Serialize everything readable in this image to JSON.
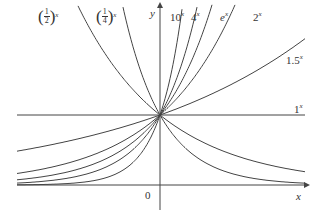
{
  "chart_data": {
    "type": "line",
    "title": "",
    "xlabel": "x",
    "ylabel": "y",
    "origin_label": "0",
    "series": [
      {
        "name": "(1/2)^x",
        "base": 0.5
      },
      {
        "name": "(1/4)^x",
        "base": 0.25
      },
      {
        "name": "10^x",
        "base": 10
      },
      {
        "name": "4^x",
        "base": 4
      },
      {
        "name": "e^x",
        "base": 2.718
      },
      {
        "name": "2^x",
        "base": 2
      },
      {
        "name": "1.5^x",
        "base": 1.5
      },
      {
        "name": "1^x",
        "base": 1
      }
    ],
    "common_point": [
      0,
      1
    ],
    "grid": false,
    "legend": "inline labels at curve ends"
  },
  "layout": {
    "origin_px": [
      160,
      185
    ],
    "unit_y_px": 70,
    "unit_x_px": 55,
    "x_axis": {
      "from": 17,
      "to": 305
    },
    "y_axis": {
      "from": 210,
      "to": 6
    },
    "line_color": "#444444"
  },
  "labels": {
    "half": {
      "num": "1",
      "den": "2",
      "exp": "x"
    },
    "quarter": {
      "num": "1",
      "den": "4",
      "exp": "x"
    },
    "ten": {
      "base": "10",
      "exp": "x"
    },
    "four": {
      "base": "4",
      "exp": "x"
    },
    "e": {
      "base": "e",
      "exp": "x"
    },
    "two": {
      "base": "2",
      "exp": "x"
    },
    "onefive": {
      "base": "1.5",
      "exp": "x"
    },
    "one": {
      "base": "1",
      "exp": "x"
    },
    "x_axis": "x",
    "y_axis": "y",
    "origin": "0"
  }
}
